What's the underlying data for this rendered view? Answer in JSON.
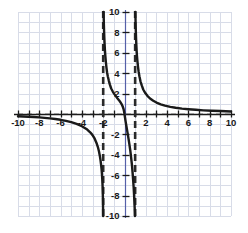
{
  "chart_data": {
    "type": "line",
    "title": "",
    "subtitle": "",
    "xlabel": "",
    "ylabel": "",
    "xlim": [
      -10,
      10
    ],
    "ylim": [
      -10,
      10
    ],
    "grid": true,
    "grid_step": 1,
    "legend": "none",
    "x_ticks": [
      -10,
      -8,
      -6,
      -4,
      -2,
      2,
      4,
      6,
      8,
      10
    ],
    "y_ticks": [
      -10,
      -8,
      -6,
      -4,
      -2,
      2,
      4,
      6,
      8,
      10
    ],
    "x_tick_labels": [
      "-10",
      "-8",
      "-6",
      "-4",
      "-2",
      "2",
      "4",
      "6",
      "8",
      "10"
    ],
    "y_tick_labels": [
      "-10",
      "-8",
      "-6",
      "-4",
      "-2",
      "2",
      "4",
      "6",
      "8",
      "10"
    ],
    "tick_interval": 2,
    "minor_tick_interval": 1,
    "asymptotes": {
      "vertical": [
        -2,
        1
      ],
      "horizontal": [
        0
      ],
      "style": "dashed"
    },
    "series": [
      {
        "name": "branch-left",
        "description": "left branch, x from -10 to -2, approaches y=0 from below on the left and falls to -infinity at x=-2",
        "points": [
          [
            -10.0,
            -0.22
          ],
          [
            -9.5,
            -0.24
          ],
          [
            -9.0,
            -0.27
          ],
          [
            -8.5,
            -0.3
          ],
          [
            -8.0,
            -0.33
          ],
          [
            -7.5,
            -0.38
          ],
          [
            -7.0,
            -0.43
          ],
          [
            -6.5,
            -0.49
          ],
          [
            -6.0,
            -0.57
          ],
          [
            -5.5,
            -0.67
          ],
          [
            -5.0,
            -0.8
          ],
          [
            -4.5,
            -0.97
          ],
          [
            -4.0,
            -1.2
          ],
          [
            -3.5,
            -1.53
          ],
          [
            -3.2,
            -1.82
          ],
          [
            -3.0,
            -2.07
          ],
          [
            -2.8,
            -2.42
          ],
          [
            -2.6,
            -2.92
          ],
          [
            -2.5,
            -3.24
          ],
          [
            -2.4,
            -3.65
          ],
          [
            -2.3,
            -4.2
          ],
          [
            -2.25,
            -4.55
          ],
          [
            -2.2,
            -4.95
          ],
          [
            -2.15,
            -5.45
          ],
          [
            -2.12,
            -5.85
          ],
          [
            -2.09,
            -6.35
          ],
          [
            -2.06,
            -7.0
          ],
          [
            -2.04,
            -7.65
          ],
          [
            -2.03,
            -8.1
          ],
          [
            -2.02,
            -8.7
          ],
          [
            -2.015,
            -9.1
          ],
          [
            -2.01,
            -9.55
          ],
          [
            -2.007,
            -10.0
          ]
        ]
      },
      {
        "name": "branch-middle",
        "description": "middle branch between the asymptotes, enters from the top at x=-2, descends through the region, crosses near the origin and plunges to -infinity at x=1",
        "points": [
          [
            -1.96,
            10.0
          ],
          [
            -1.95,
            9.4
          ],
          [
            -1.94,
            8.9
          ],
          [
            -1.92,
            8.2
          ],
          [
            -1.9,
            7.6
          ],
          [
            -1.87,
            6.9
          ],
          [
            -1.84,
            6.3
          ],
          [
            -1.8,
            5.7
          ],
          [
            -1.75,
            5.1
          ],
          [
            -1.7,
            4.6
          ],
          [
            -1.64,
            4.1
          ],
          [
            -1.57,
            3.7
          ],
          [
            -1.48,
            3.3
          ],
          [
            -1.38,
            2.9
          ],
          [
            -1.25,
            2.5
          ],
          [
            -1.1,
            2.2
          ],
          [
            -0.95,
            1.95
          ],
          [
            -0.8,
            1.73
          ],
          [
            -0.65,
            1.52
          ],
          [
            -0.5,
            1.33
          ],
          [
            -0.4,
            1.18
          ],
          [
            -0.3,
            1.02
          ],
          [
            -0.22,
            0.86
          ],
          [
            -0.15,
            0.68
          ],
          [
            -0.08,
            0.45
          ],
          [
            -0.03,
            0.2
          ],
          [
            0.0,
            0.0
          ],
          [
            0.04,
            -0.3
          ],
          [
            0.1,
            -0.7
          ],
          [
            0.18,
            -1.2
          ],
          [
            0.27,
            -1.75
          ],
          [
            0.36,
            -2.3
          ],
          [
            0.45,
            -2.9
          ],
          [
            0.54,
            -3.55
          ],
          [
            0.62,
            -4.25
          ],
          [
            0.7,
            -5.0
          ],
          [
            0.76,
            -5.75
          ],
          [
            0.81,
            -6.45
          ],
          [
            0.86,
            -7.2
          ],
          [
            0.9,
            -7.95
          ],
          [
            0.93,
            -8.6
          ],
          [
            0.95,
            -9.1
          ],
          [
            0.97,
            -9.6
          ],
          [
            0.98,
            -10.0
          ]
        ]
      },
      {
        "name": "branch-right",
        "description": "right branch, rises to +infinity at x=1 and decays toward y=0 as x increases to 10",
        "points": [
          [
            1.02,
            10.0
          ],
          [
            1.03,
            9.5
          ],
          [
            1.04,
            9.0
          ],
          [
            1.05,
            8.5
          ],
          [
            1.07,
            7.9
          ],
          [
            1.09,
            7.3
          ],
          [
            1.11,
            6.8
          ],
          [
            1.14,
            6.2
          ],
          [
            1.17,
            5.7
          ],
          [
            1.21,
            5.2
          ],
          [
            1.26,
            4.7
          ],
          [
            1.32,
            4.2
          ],
          [
            1.4,
            3.7
          ],
          [
            1.5,
            3.2
          ],
          [
            1.62,
            2.8
          ],
          [
            1.76,
            2.4
          ],
          [
            1.95,
            2.05
          ],
          [
            2.15,
            1.78
          ],
          [
            2.4,
            1.52
          ],
          [
            2.7,
            1.3
          ],
          [
            3.0,
            1.12
          ],
          [
            3.4,
            0.95
          ],
          [
            3.8,
            0.82
          ],
          [
            4.3,
            0.7
          ],
          [
            4.8,
            0.61
          ],
          [
            5.4,
            0.53
          ],
          [
            6.0,
            0.47
          ],
          [
            6.7,
            0.41
          ],
          [
            7.4,
            0.36
          ],
          [
            8.2,
            0.32
          ],
          [
            9.0,
            0.29
          ],
          [
            10.0,
            0.25
          ]
        ]
      }
    ]
  },
  "style": {
    "curve_color": "#1a1a1a",
    "axis_color": "#1a1a1a",
    "grid_color": "#d8dce8",
    "asymptote_color": "#2a2a2a",
    "label_color": "#1a1a1a",
    "background": "#ffffff"
  },
  "geometry": {
    "plot_left": 18,
    "plot_right": 231,
    "plot_top": 12,
    "plot_bottom": 216,
    "origin_x": 124,
    "origin_y": 114
  }
}
